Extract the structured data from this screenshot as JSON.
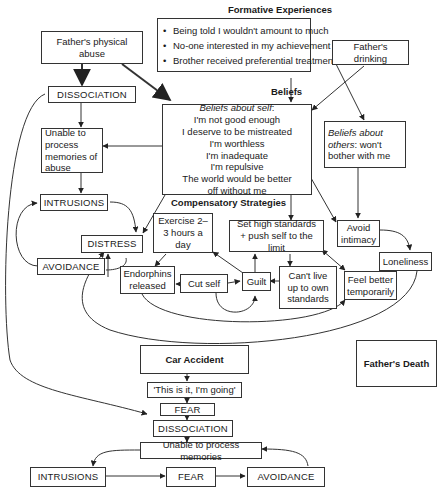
{
  "diagram": {
    "headings": {
      "formative": "Formative Experiences",
      "beliefs": "Beliefs",
      "compensatory": "Compensatory Strategies"
    },
    "formative_experiences": [
      "Being told I wouldn't amount to much",
      "No-one interested in my achievement",
      "Brother received preferential treatment"
    ],
    "fathers_drinking": "Father's drinking",
    "fathers_abuse": "Father's physical abuse",
    "dissociation_top": "DISSOCIATION",
    "unable_process_abuse": "Unable to process memories of abuse",
    "intrusions_top": "INTRUSIONS",
    "avoidance_top": "AVOIDANCE",
    "distress": "DISTRESS",
    "beliefs_self": {
      "label": "Beliefs about self",
      "items": [
        "I'm not good enough",
        "I deserve to be mistreated",
        "I'm worthless",
        "I'm inadequate",
        "I'm repulsive",
        "The world would be better off without me"
      ]
    },
    "beliefs_others": {
      "label": "Beliefs about others",
      "text": ": won't bother with me"
    },
    "avoid_intimacy": "Avoid intimacy",
    "loneliness": "Loneliness",
    "exercise": "Exercise 2–3 hours a day",
    "high_standards": "Set high standards + push self to the limit",
    "endorphins": "Endorphins released",
    "cut_self": "Cut self",
    "guilt": "Guilt",
    "cant_live_up": "Can't live up to own standards",
    "feel_better": "Feel better temporarily",
    "car_accident": "Car Accident",
    "this_is_it": "'This is it, I'm going'",
    "fear_mid": "FEAR",
    "dissociation_bottom": "DISSOCIATION",
    "unable_process_memories": "Unable to process memories",
    "intrusions_bottom": "INTRUSIONS",
    "fear_bottom": "FEAR",
    "avoidance_bottom": "AVOIDANCE",
    "fathers_death": "Father's Death"
  },
  "colors": {
    "stroke": "#333333",
    "background": "#ffffff",
    "text": "#1a1a1a"
  }
}
